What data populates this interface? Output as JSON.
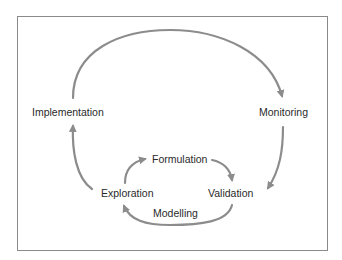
{
  "diagram": {
    "type": "cycle",
    "outer_cycle": [
      "Implementation",
      "Monitoring",
      "Validation",
      "Exploration"
    ],
    "inner_cycle": [
      "Exploration",
      "Formulation",
      "Validation"
    ],
    "nodes": {
      "implementation": "Implementation",
      "monitoring": "Monitoring",
      "formulation": "Formulation",
      "exploration": "Exploration",
      "validation": "Validation"
    },
    "edge_labels": {
      "modelling": "Modelling"
    },
    "colors": {
      "arrow": "#8c8c8c",
      "text": "#2a2a2a",
      "border": "#8a8a8a"
    }
  }
}
